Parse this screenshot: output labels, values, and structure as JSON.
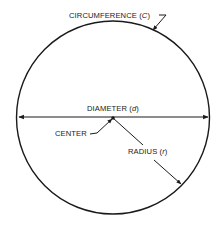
{
  "diagram": {
    "colors": {
      "ink": "#1a1a1a",
      "background": "#ffffff"
    },
    "circle": {
      "cx": 113,
      "cy": 117,
      "r": 96.5
    },
    "labels": {
      "circumference": "CIRCUMFERENCE (",
      "circumference_var": "C",
      "circumference_close": ")",
      "diameter": "DIAMETER (",
      "diameter_var": "d",
      "diameter_close": ")",
      "center": "CENTER",
      "radius": "RADIUS (",
      "radius_var": "r",
      "radius_close": ")"
    }
  }
}
